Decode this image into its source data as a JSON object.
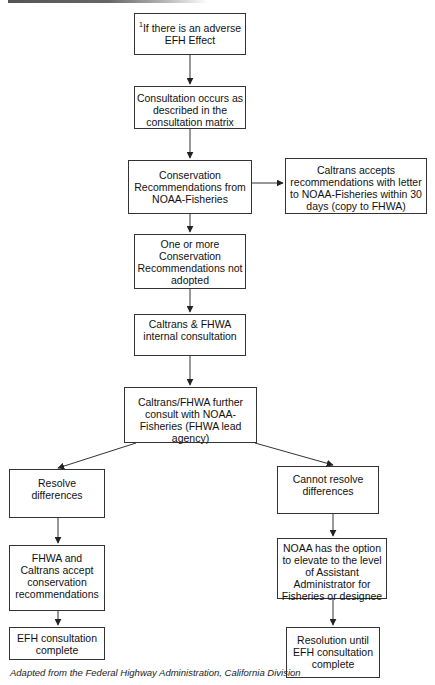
{
  "diagram": {
    "type": "flowchart",
    "nodes": {
      "start": {
        "footnote": "1",
        "text": "If there is an adverse\nEFH Effect"
      },
      "consultation": {
        "text": "Consultation occurs as\ndescribed in the\nconsultation matrix"
      },
      "recommendations": {
        "text": "Conservation\nRecommendations from\nNOAA-Fisheries"
      },
      "accepts": {
        "text": "Caltrans accepts\nrecommendations with letter\nto NOAA-Fisheries within 30\ndays (copy to FHWA)"
      },
      "not_adopted": {
        "text": "One or more\nConservation\nRecommendations not\nadopted"
      },
      "internal": {
        "text": "Caltrans & FHWA\ninternal consultation"
      },
      "further_consult": {
        "text": "Caltrans/FHWA further\nconsult with NOAA-\nFisheries (FHWA lead\nagency)"
      },
      "resolve": {
        "text": "Resolve\ndifferences"
      },
      "cannot_resolve": {
        "text": "Cannot resolve\ndifferences"
      },
      "fhwa_accept": {
        "text": "FHWA and\nCaltrans accept\nconservation\nrecommendations"
      },
      "noaa_elevate": {
        "text": "NOAA has the option\nto elevate to the level\nof Assistant\nAdministrator for\nFisheries or designee"
      },
      "complete_left": {
        "text": "EFH consultation\ncomplete"
      },
      "complete_right": {
        "text": "Resolution until\nEFH consultation\ncomplete"
      }
    },
    "edges": [
      [
        "start",
        "consultation"
      ],
      [
        "consultation",
        "recommendations"
      ],
      [
        "recommendations",
        "accepts"
      ],
      [
        "recommendations",
        "not_adopted"
      ],
      [
        "not_adopted",
        "internal"
      ],
      [
        "internal",
        "further_consult"
      ],
      [
        "further_consult",
        "resolve"
      ],
      [
        "further_consult",
        "cannot_resolve"
      ],
      [
        "resolve",
        "fhwa_accept"
      ],
      [
        "fhwa_accept",
        "complete_left"
      ],
      [
        "cannot_resolve",
        "noaa_elevate"
      ],
      [
        "noaa_elevate",
        "complete_right"
      ]
    ],
    "caption": "Adapted from the Federal Highway Administration, California Division"
  }
}
